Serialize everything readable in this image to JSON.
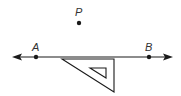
{
  "diagram": {
    "colors": {
      "stroke": "#1a1a1a",
      "label": "#333333",
      "background": "#ffffff"
    },
    "point_p": {
      "label": "P",
      "x": 79,
      "y": 22
    },
    "line": {
      "x1": 13,
      "y1": 57,
      "x2": 172,
      "y2": 57,
      "arrows": "both",
      "points": [
        {
          "label": "A",
          "x": 36,
          "y": 57
        },
        {
          "label": "B",
          "x": 149,
          "y": 57
        }
      ]
    },
    "set_square": {
      "outer": [
        [
          62,
          59
        ],
        [
          114,
          59
        ],
        [
          114,
          92
        ]
      ],
      "inner": [
        [
          90,
          68
        ],
        [
          106,
          68
        ],
        [
          106,
          78
        ]
      ]
    }
  }
}
